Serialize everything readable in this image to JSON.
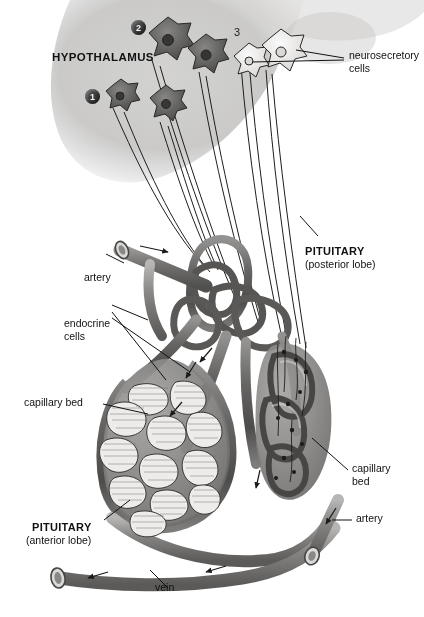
{
  "figure": {
    "type": "anatomical-diagram"
  },
  "labels": {
    "hypothalamus": "HYPOTHALAMUS",
    "neurosecretory_cells": "neurosecretory\ncells",
    "neurosecretory_cells_line1": "neurosecretory",
    "neurosecretory_cells_line2": "cells",
    "pituitary_posterior_title": "PITUITARY",
    "pituitary_posterior_sub": "(posterior lobe)",
    "pituitary_anterior_title": "PITUITARY",
    "pituitary_anterior_sub": "(anterior lobe)",
    "artery_left": "artery",
    "artery_right": "artery",
    "endocrine_cells_line1": "endocrine",
    "endocrine_cells_line2": "cells",
    "capillary_bed_left": "capillary bed",
    "capillary_bed_right_line1": "capillary",
    "capillary_bed_right_line2": "bed",
    "vein": "vein"
  },
  "markers": [
    {
      "id": "marker-1",
      "text": "1",
      "style": "filled-circle"
    },
    {
      "id": "marker-2",
      "text": "2",
      "style": "filled-circle"
    },
    {
      "id": "marker-3",
      "text": "3",
      "style": "plain-text"
    }
  ],
  "colors": {
    "ink": "#111111",
    "vessel_dark": "#4a443e",
    "vessel_mid": "#8a8178",
    "vessel_light": "#c3bbb1",
    "tissue_gray": "#b9b4ad",
    "cell_dark": "#6d6860",
    "cell_pale": "#f2efe9",
    "background": "#ffffff",
    "marker_fill": "#3f3f3f"
  },
  "structures": {
    "hypothalamus_cells_dark_count": 4,
    "hypothalamus_cells_pale_count": 2,
    "anterior_lobe_cell_clusters": 12,
    "flow_arrows": 7
  }
}
